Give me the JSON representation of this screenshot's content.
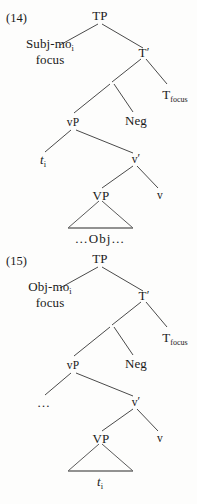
{
  "page": {
    "width": 197,
    "height": 504,
    "background": "#fdfdfc",
    "ink": "#1a1a1a",
    "line_color": "#4a4a4a"
  },
  "figures": [
    {
      "number": "(14)",
      "nodes": {
        "tp": "TP",
        "spec": {
          "line1_text": "Subj-mo",
          "line1_sub": "i",
          "line2": "focus"
        },
        "tbar": "T",
        "tbar_prime": "′",
        "t_focus": "T",
        "t_focus_sub": "focus",
        "vp_small": "vP",
        "neg": "Neg",
        "trace": "t",
        "trace_sub": "i",
        "vbar": "v",
        "vbar_prime": "′",
        "vp_big": "VP",
        "v": "v",
        "triangle_label": "…Obj…"
      }
    },
    {
      "number": "(15)",
      "nodes": {
        "tp": "TP",
        "spec": {
          "line1_text": "Obj-mo",
          "line1_sub": "i",
          "line2": "focus"
        },
        "tbar": "T",
        "tbar_prime": "′",
        "t_focus": "T",
        "t_focus_sub": "focus",
        "vp_small": "vP",
        "neg": "Neg",
        "ellipsis": "…",
        "vbar": "v",
        "vbar_prime": "′",
        "vp_big": "VP",
        "v": "v",
        "triangle_label_text": "t",
        "triangle_label_sub": "i"
      }
    }
  ],
  "footer": {
    "cut_text": "……………………"
  }
}
